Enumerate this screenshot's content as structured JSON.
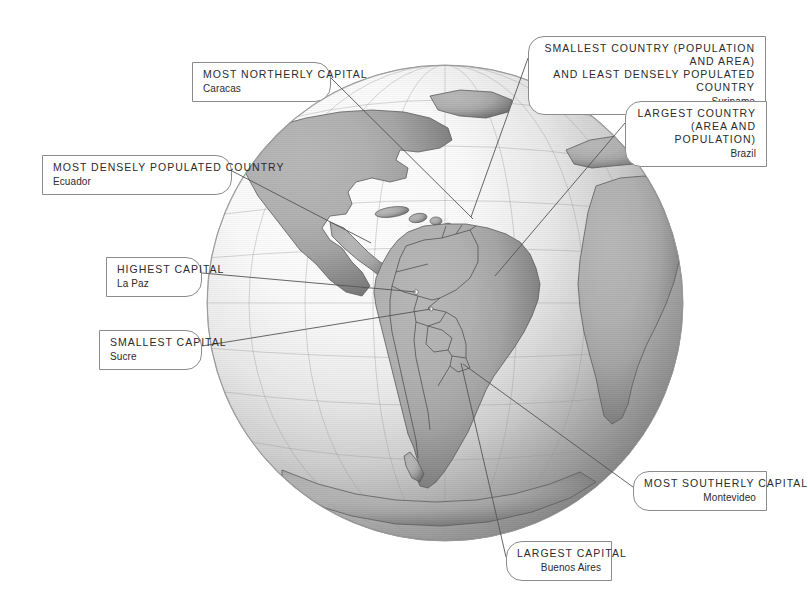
{
  "background_color": "#ffffff",
  "globe": {
    "name": "south-america-globe",
    "center_x": 445,
    "center_y": 303,
    "radius": 238,
    "ocean_light_color": "#fbfbfb",
    "ocean_shadow_color": "#6e6e6e",
    "land_color": "#a8a8a8",
    "land_shadow_color": "#6a6a6a",
    "border_color": "#4a4a4a",
    "outline_color": "#8f8f8f"
  },
  "leader_line": {
    "color": "#555555",
    "width": 0.9
  },
  "callouts": [
    {
      "id": "most-northerly-capital",
      "side": "left",
      "title": "MOST NORTHERLY CAPITAL",
      "subtitle": "Caracas",
      "box": {
        "left": 192,
        "top": 62,
        "width": 139,
        "height": 32
      },
      "anchor": {
        "x": 473,
        "y": 219
      }
    },
    {
      "id": "most-densely-populated-country",
      "side": "left",
      "title": "MOST DENSELY POPULATED COUNTRY",
      "subtitle": "Ecuador",
      "box": {
        "left": 42,
        "top": 155,
        "width": 190,
        "height": 32
      },
      "anchor": {
        "x": 371,
        "y": 243
      }
    },
    {
      "id": "highest-capital",
      "side": "left",
      "title": "HIGHEST CAPITAL",
      "subtitle": "La Paz",
      "box": {
        "left": 106,
        "top": 257,
        "width": 96,
        "height": 32
      },
      "anchor": {
        "x": 416,
        "y": 292
      }
    },
    {
      "id": "smallest-capital",
      "side": "left",
      "title": "SMALLEST CAPITAL",
      "subtitle": "Sucre",
      "box": {
        "left": 99,
        "top": 330,
        "width": 103,
        "height": 32
      },
      "anchor": {
        "x": 431,
        "y": 309
      }
    },
    {
      "id": "smallest-country",
      "side": "right",
      "title": "SMALLEST COUNTRY (POPULATION AND AREA)\nAND LEAST DENSELY POPULATED COUNTRY",
      "subtitle": "Suriname",
      "box": {
        "left": 528,
        "top": 36,
        "width": 238,
        "height": 45
      },
      "anchor": {
        "x": 471,
        "y": 217
      }
    },
    {
      "id": "largest-country",
      "side": "right",
      "title": "LARGEST COUNTRY\n(AREA AND POPULATION)",
      "subtitle": "Brazil",
      "box": {
        "left": 625,
        "top": 101,
        "width": 142,
        "height": 45
      },
      "anchor": {
        "x": 495,
        "y": 276
      }
    },
    {
      "id": "most-southerly-capital",
      "side": "right",
      "title": "MOST SOUTHERLY CAPITAL",
      "subtitle": "Montevideo",
      "box": {
        "left": 633,
        "top": 471,
        "width": 134,
        "height": 32
      },
      "anchor": {
        "x": 463,
        "y": 364
      }
    },
    {
      "id": "largest-capital",
      "side": "right",
      "title": "LARGEST CAPITAL",
      "subtitle": "Buenos Aires",
      "box": {
        "left": 506,
        "top": 541,
        "width": 106,
        "height": 32
      },
      "anchor": {
        "x": 461,
        "y": 363
      }
    }
  ]
}
